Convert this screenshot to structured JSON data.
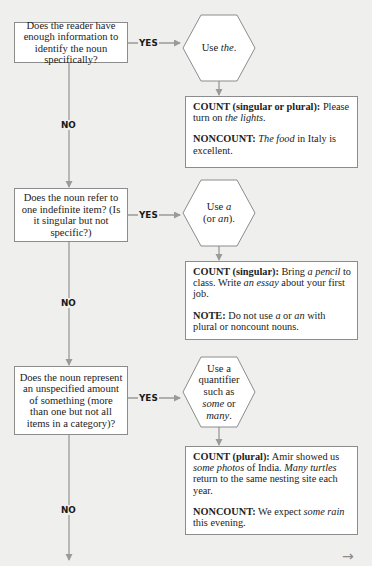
{
  "flowchart": {
    "colors": {
      "background": "#efefed",
      "box_fill": "#ffffff",
      "box_border": "#8c8c8c",
      "connector": "#9a9a9a",
      "label_text": "#1a1a1a"
    },
    "steps": [
      {
        "question": "Does the reader have enough information to identify the noun specifically?",
        "yes_label": "YES",
        "no_label": "NO",
        "action": {
          "parts": [
            {
              "text": "Use ",
              "style": "normal"
            },
            {
              "text": "the",
              "style": "italic"
            },
            {
              "text": ".",
              "style": "normal"
            }
          ]
        },
        "examples": [
          {
            "parts": [
              {
                "text": "COUNT (singular or plural):",
                "style": "bold"
              },
              {
                "text": " Please turn on ",
                "style": "normal"
              },
              {
                "text": "the lights",
                "style": "italic"
              },
              {
                "text": ".",
                "style": "normal"
              }
            ]
          },
          {
            "parts": [
              {
                "text": "NONCOUNT:",
                "style": "bold"
              },
              {
                "text": " ",
                "style": "normal"
              },
              {
                "text": "The food",
                "style": "italic"
              },
              {
                "text": " in Italy is excellent.",
                "style": "normal"
              }
            ]
          }
        ]
      },
      {
        "question": "Does the noun refer to one indefinite item? (Is it singular but not specific?)",
        "yes_label": "YES",
        "no_label": "NO",
        "action": {
          "parts": [
            {
              "text": "Use ",
              "style": "normal"
            },
            {
              "text": "a",
              "style": "italic"
            },
            {
              "text": "\n(or ",
              "style": "normal"
            },
            {
              "text": "an",
              "style": "italic"
            },
            {
              "text": ").",
              "style": "normal"
            }
          ]
        },
        "examples": [
          {
            "parts": [
              {
                "text": "COUNT (singular):",
                "style": "bold"
              },
              {
                "text": " Bring ",
                "style": "normal"
              },
              {
                "text": "a pencil",
                "style": "italic"
              },
              {
                "text": " to class. Write ",
                "style": "normal"
              },
              {
                "text": "an essay",
                "style": "italic"
              },
              {
                "text": " about your first job.",
                "style": "normal"
              }
            ]
          },
          {
            "parts": [
              {
                "text": "NOTE:",
                "style": "bold"
              },
              {
                "text": " Do not use ",
                "style": "normal"
              },
              {
                "text": "a",
                "style": "italic"
              },
              {
                "text": " or ",
                "style": "normal"
              },
              {
                "text": "an",
                "style": "italic"
              },
              {
                "text": " with plural or noncount nouns.",
                "style": "normal"
              }
            ]
          }
        ]
      },
      {
        "question": "Does the noun represent an unspecified amount of something (more than one but not all items in a category)?",
        "yes_label": "YES",
        "no_label": "NO",
        "action": {
          "parts": [
            {
              "text": "Use a\nquantifier\nsuch as\n",
              "style": "normal"
            },
            {
              "text": "some",
              "style": "italic"
            },
            {
              "text": " or\n",
              "style": "normal"
            },
            {
              "text": "many",
              "style": "italic"
            },
            {
              "text": ".",
              "style": "normal"
            }
          ]
        },
        "examples": [
          {
            "parts": [
              {
                "text": "COUNT (plural):",
                "style": "bold"
              },
              {
                "text": " Amir showed us ",
                "style": "normal"
              },
              {
                "text": "some photos",
                "style": "italic"
              },
              {
                "text": " of India. ",
                "style": "normal"
              },
              {
                "text": "Many turtles",
                "style": "italic"
              },
              {
                "text": " return to the same nesting site each year.",
                "style": "normal"
              }
            ]
          },
          {
            "parts": [
              {
                "text": "NONCOUNT:",
                "style": "bold"
              },
              {
                "text": " We expect ",
                "style": "normal"
              },
              {
                "text": "some rain",
                "style": "italic"
              },
              {
                "text": " this evening.",
                "style": "normal"
              }
            ]
          }
        ]
      }
    ],
    "continue_icon": "arrow-right-icon",
    "continue_glyph": "→"
  }
}
